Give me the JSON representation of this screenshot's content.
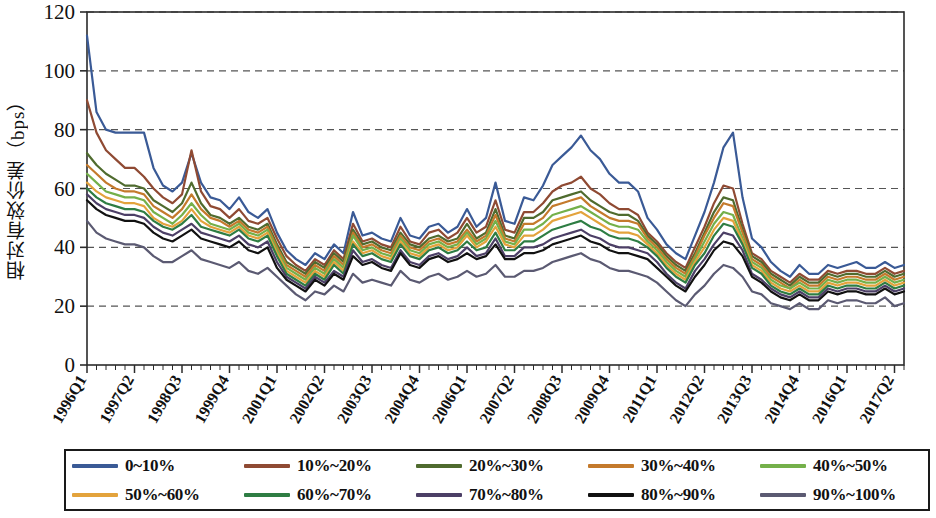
{
  "figure": {
    "ylabel": "相对有效价差（bps）",
    "plot_bg": "#ffffff",
    "axis_color": "#2b2b2b",
    "grid_color": "#555555"
  },
  "legend": {
    "rows": [
      [
        {
          "label": "0~10%",
          "color": "#3a5a96"
        },
        {
          "label": "10%~20%",
          "color": "#8f4a33"
        },
        {
          "label": "20%~30%",
          "color": "#4f6b2e"
        },
        {
          "label": "30%~40%",
          "color": "#c47a2c"
        },
        {
          "label": "40%~50%",
          "color": "#74b04a"
        }
      ],
      [
        {
          "label": "50%~60%",
          "color": "#e3a33c"
        },
        {
          "label": "60%~70%",
          "color": "#2e7d43"
        },
        {
          "label": "70%~80%",
          "color": "#4c3f66"
        },
        {
          "label": "80%~90%",
          "color": "#111111"
        },
        {
          "label": "90%~100%",
          "color": "#5b5a72"
        }
      ]
    ]
  },
  "chart_data": {
    "type": "line",
    "title": "",
    "xlabel": "",
    "ylabel": "相对有效价差（bps）",
    "ylim": [
      0,
      120
    ],
    "yticks": [
      0,
      20,
      40,
      60,
      80,
      100,
      120
    ],
    "grid": "horizontal-dashed",
    "legend_position": "bottom",
    "x_tick_labels": [
      "1996Q1",
      "1997Q2",
      "1998Q3",
      "1999Q4",
      "2001Q1",
      "2002Q2",
      "2003Q3",
      "2004Q4",
      "2006Q1",
      "2007Q2",
      "2008Q3",
      "2009Q4",
      "2011Q1",
      "2012Q2",
      "2013Q3",
      "2014Q4",
      "2016Q1",
      "2017Q2"
    ],
    "x_tick_every": 5,
    "n_points": 87,
    "series": [
      {
        "name": "0~10%",
        "color": "#3a5a96",
        "values": [
          112,
          86,
          80,
          79,
          79,
          79,
          79,
          67,
          61,
          59,
          62,
          72,
          62,
          57,
          56,
          53,
          57,
          52,
          50,
          53,
          45,
          39,
          36,
          34,
          38,
          36,
          41,
          38,
          52,
          44,
          45,
          43,
          42,
          50,
          44,
          43,
          47,
          48,
          45,
          47,
          53,
          47,
          50,
          62,
          49,
          48,
          57,
          56,
          61,
          68,
          71,
          74,
          78,
          73,
          70,
          65,
          62,
          62,
          59,
          50,
          46,
          41,
          38,
          36,
          44,
          52,
          62,
          74,
          79,
          57,
          43,
          40,
          35,
          32,
          30,
          34,
          31,
          31,
          34,
          33,
          34,
          35,
          33,
          33,
          35,
          33,
          34
        ]
      },
      {
        "name": "10%~20%",
        "color": "#8f4a33",
        "values": [
          90,
          79,
          73,
          70,
          67,
          67,
          64,
          60,
          57,
          55,
          58,
          73,
          59,
          54,
          53,
          50,
          53,
          49,
          48,
          50,
          43,
          37,
          34,
          32,
          36,
          34,
          39,
          36,
          48,
          42,
          43,
          41,
          40,
          47,
          42,
          41,
          45,
          46,
          43,
          45,
          50,
          45,
          47,
          56,
          46,
          45,
          52,
          52,
          55,
          59,
          61,
          62,
          64,
          60,
          58,
          55,
          53,
          53,
          51,
          45,
          42,
          38,
          35,
          33,
          40,
          47,
          55,
          61,
          60,
          48,
          38,
          36,
          32,
          30,
          28,
          31,
          29,
          29,
          32,
          31,
          32,
          32,
          31,
          31,
          33,
          31,
          32
        ]
      },
      {
        "name": "20%~30%",
        "color": "#4f6b2e",
        "values": [
          72,
          68,
          65,
          63,
          61,
          61,
          60,
          56,
          54,
          52,
          55,
          62,
          55,
          51,
          50,
          48,
          50,
          47,
          46,
          48,
          41,
          35,
          33,
          31,
          35,
          33,
          38,
          35,
          46,
          41,
          42,
          40,
          39,
          45,
          41,
          40,
          43,
          44,
          42,
          43,
          48,
          43,
          45,
          53,
          44,
          43,
          50,
          50,
          52,
          56,
          57,
          58,
          59,
          56,
          54,
          52,
          51,
          51,
          49,
          44,
          41,
          37,
          34,
          32,
          38,
          45,
          52,
          57,
          56,
          46,
          37,
          35,
          31,
          29,
          27,
          30,
          28,
          28,
          31,
          30,
          31,
          31,
          30,
          30,
          32,
          30,
          31
        ]
      },
      {
        "name": "30%~40%",
        "color": "#c47a2c",
        "values": [
          68,
          65,
          62,
          60,
          59,
          59,
          58,
          54,
          52,
          50,
          53,
          58,
          53,
          50,
          49,
          47,
          49,
          46,
          45,
          47,
          40,
          34,
          32,
          30,
          34,
          32,
          37,
          34,
          45,
          40,
          41,
          39,
          38,
          44,
          40,
          39,
          42,
          43,
          41,
          42,
          46,
          42,
          44,
          51,
          43,
          42,
          48,
          48,
          50,
          54,
          55,
          56,
          57,
          54,
          52,
          50,
          49,
          49,
          48,
          43,
          40,
          36,
          33,
          31,
          37,
          44,
          50,
          55,
          54,
          45,
          36,
          34,
          30,
          28,
          26,
          29,
          27,
          27,
          30,
          29,
          30,
          30,
          29,
          29,
          31,
          29,
          30
        ]
      },
      {
        "name": "40%~50%",
        "color": "#74b04a",
        "values": [
          65,
          62,
          59,
          58,
          57,
          57,
          56,
          52,
          50,
          48,
          51,
          55,
          51,
          48,
          47,
          46,
          48,
          45,
          44,
          46,
          39,
          33,
          31,
          29,
          33,
          31,
          36,
          33,
          44,
          39,
          40,
          38,
          37,
          43,
          39,
          38,
          41,
          42,
          40,
          41,
          45,
          41,
          43,
          49,
          42,
          41,
          46,
          46,
          48,
          51,
          52,
          53,
          54,
          52,
          50,
          48,
          47,
          47,
          46,
          42,
          39,
          35,
          32,
          30,
          36,
          42,
          48,
          52,
          51,
          43,
          35,
          33,
          29,
          27,
          26,
          28,
          26,
          26,
          29,
          28,
          29,
          29,
          28,
          28,
          30,
          28,
          29
        ]
      },
      {
        "name": "50%~60%",
        "color": "#e3a33c",
        "values": [
          62,
          59,
          57,
          56,
          55,
          55,
          54,
          50,
          48,
          47,
          49,
          53,
          49,
          47,
          46,
          45,
          47,
          44,
          43,
          45,
          38,
          32,
          30,
          28,
          32,
          30,
          35,
          32,
          42,
          38,
          39,
          37,
          36,
          42,
          38,
          37,
          40,
          41,
          39,
          40,
          44,
          40,
          42,
          47,
          41,
          40,
          44,
          44,
          46,
          49,
          50,
          51,
          52,
          50,
          48,
          46,
          45,
          45,
          44,
          41,
          38,
          34,
          31,
          29,
          35,
          40,
          46,
          50,
          49,
          42,
          34,
          32,
          28,
          26,
          25,
          27,
          25,
          25,
          28,
          27,
          28,
          28,
          27,
          27,
          29,
          27,
          28
        ]
      },
      {
        "name": "60%~70%",
        "color": "#2e7d43",
        "values": [
          60,
          57,
          55,
          54,
          53,
          53,
          52,
          49,
          47,
          46,
          48,
          51,
          47,
          46,
          45,
          44,
          46,
          43,
          42,
          44,
          37,
          31,
          29,
          27,
          31,
          29,
          34,
          31,
          41,
          37,
          38,
          36,
          35,
          41,
          37,
          36,
          39,
          40,
          38,
          39,
          42,
          39,
          40,
          45,
          39,
          39,
          42,
          42,
          44,
          46,
          47,
          48,
          49,
          47,
          46,
          44,
          43,
          43,
          42,
          40,
          37,
          33,
          30,
          28,
          34,
          38,
          44,
          48,
          47,
          41,
          33,
          31,
          27,
          25,
          24,
          26,
          24,
          24,
          27,
          26,
          27,
          27,
          26,
          26,
          28,
          26,
          27
        ]
      },
      {
        "name": "70%~80%",
        "color": "#4c3f66",
        "values": [
          58,
          55,
          53,
          52,
          51,
          51,
          50,
          47,
          45,
          44,
          46,
          48,
          45,
          44,
          43,
          42,
          44,
          41,
          40,
          42,
          35,
          30,
          28,
          26,
          30,
          28,
          32,
          30,
          39,
          35,
          36,
          34,
          33,
          39,
          35,
          34,
          37,
          38,
          36,
          37,
          40,
          37,
          38,
          43,
          37,
          37,
          40,
          40,
          41,
          43,
          44,
          45,
          46,
          44,
          43,
          41,
          40,
          40,
          39,
          38,
          35,
          31,
          28,
          26,
          32,
          36,
          41,
          45,
          44,
          39,
          31,
          29,
          26,
          24,
          23,
          25,
          23,
          23,
          26,
          25,
          26,
          26,
          25,
          25,
          27,
          25,
          26
        ]
      },
      {
        "name": "80%~90%",
        "color": "#111111",
        "values": [
          56,
          53,
          51,
          50,
          49,
          49,
          48,
          45,
          43,
          42,
          44,
          46,
          43,
          42,
          41,
          40,
          42,
          39,
          38,
          40,
          33,
          29,
          27,
          25,
          29,
          27,
          31,
          29,
          37,
          34,
          35,
          33,
          32,
          38,
          34,
          33,
          36,
          37,
          35,
          36,
          38,
          36,
          37,
          41,
          36,
          36,
          38,
          38,
          39,
          41,
          42,
          43,
          44,
          42,
          41,
          39,
          38,
          38,
          37,
          36,
          33,
          30,
          27,
          25,
          30,
          34,
          39,
          42,
          41,
          37,
          30,
          28,
          25,
          23,
          22,
          24,
          22,
          22,
          25,
          24,
          25,
          25,
          24,
          24,
          26,
          24,
          25
        ]
      },
      {
        "name": "90%~100%",
        "color": "#5b5a72",
        "values": [
          49,
          45,
          43,
          42,
          41,
          41,
          40,
          37,
          35,
          35,
          37,
          39,
          36,
          35,
          34,
          33,
          35,
          32,
          31,
          33,
          30,
          27,
          24,
          22,
          25,
          24,
          27,
          25,
          31,
          28,
          29,
          28,
          27,
          32,
          29,
          28,
          30,
          31,
          29,
          30,
          32,
          30,
          31,
          34,
          30,
          30,
          32,
          32,
          33,
          35,
          36,
          37,
          38,
          36,
          35,
          33,
          32,
          32,
          31,
          30,
          28,
          25,
          22,
          20,
          24,
          27,
          31,
          34,
          33,
          30,
          25,
          24,
          21,
          20,
          19,
          21,
          19,
          19,
          22,
          21,
          22,
          22,
          21,
          21,
          23,
          20,
          21
        ]
      }
    ]
  }
}
